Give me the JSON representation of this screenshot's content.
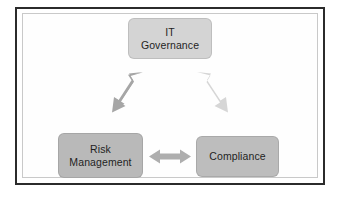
{
  "diagram": {
    "frame": {
      "outer_border_color": "#2b2b2b",
      "inner_border_color": "#c9c9c9",
      "background_color": "#ffffff"
    },
    "nodes": [
      {
        "id": "governance",
        "label": "IT\nGovernance",
        "line1": "IT",
        "line2": "Governance",
        "fill_color": "#d4d4d4",
        "text_color": "#1f1f1f",
        "position": "top-center"
      },
      {
        "id": "risk",
        "label": "Risk\nManagement",
        "line1": "Risk",
        "line2": "Management",
        "fill_color": "#b9b9b9",
        "text_color": "#1f1f1f",
        "position": "bottom-left"
      },
      {
        "id": "compliance",
        "label": "Compliance",
        "line1": "Compliance",
        "line2": "",
        "fill_color": "#bdbdbd",
        "text_color": "#1f1f1f",
        "position": "bottom-right"
      }
    ],
    "connectors": [
      {
        "id": "risk-governance",
        "from": "risk",
        "to": "governance",
        "style": "double-headed-arrow",
        "orientation": "diagonal-up-right",
        "color": "#a6a6a6"
      },
      {
        "id": "governance-compliance",
        "from": "governance",
        "to": "compliance",
        "style": "double-headed-arrow",
        "orientation": "diagonal-down-right",
        "color": "#d6d6d6"
      },
      {
        "id": "risk-compliance",
        "from": "risk",
        "to": "compliance",
        "style": "double-headed-arrow",
        "orientation": "horizontal",
        "color": "#aeaeae"
      }
    ]
  }
}
